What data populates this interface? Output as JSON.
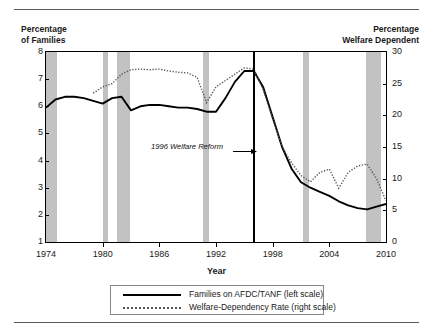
{
  "figure": {
    "left_axis_title": "Percentage\nof Families",
    "right_axis_title": "Percentage\nWelfare Dependent",
    "xaxis_label": "Year",
    "annotation": "1996 Welfare Reform"
  },
  "legend": {
    "items": [
      {
        "label": "Families on AFDC/TANF (left scale)",
        "style": "solid"
      },
      {
        "label": "Welfare-Dependency Rate (right scale)",
        "style": "dotted"
      }
    ]
  },
  "chart_data": {
    "type": "line",
    "title": "",
    "xlabel": "Year",
    "ylabel": "Percentage of Families",
    "y2label": "Percentage Welfare Dependent",
    "xlim": [
      1974,
      2010
    ],
    "ylim": [
      1,
      8
    ],
    "y2lim": [
      0,
      30
    ],
    "xticks": [
      1974,
      1980,
      1986,
      1992,
      1998,
      2004,
      2010
    ],
    "yticks": [
      1,
      2,
      3,
      4,
      5,
      6,
      7,
      8
    ],
    "y2ticks": [
      0,
      5,
      10,
      15,
      20,
      25,
      30
    ],
    "grid": false,
    "legend_position": "below-plot",
    "annotations": [
      {
        "text": "1996 Welfare Reform",
        "x": 1996,
        "style": "italic",
        "arrow": true
      }
    ],
    "recession_bands": [
      {
        "start": 1973.9,
        "end": 1975.2
      },
      {
        "start": 1980.0,
        "end": 1980.6
      },
      {
        "start": 1981.5,
        "end": 1982.9
      },
      {
        "start": 1990.6,
        "end": 1991.3
      },
      {
        "start": 2001.2,
        "end": 2001.9
      },
      {
        "start": 2007.9,
        "end": 2009.5
      }
    ],
    "series": [
      {
        "name": "Families on AFDC/TANF (left scale)",
        "axis": "left",
        "style": "solid",
        "color": "#000000",
        "x": [
          1974,
          1975,
          1976,
          1977,
          1978,
          1979,
          1980,
          1981,
          1982,
          1983,
          1984,
          1985,
          1986,
          1987,
          1988,
          1989,
          1990,
          1991,
          1992,
          1993,
          1994,
          1995,
          1996,
          1997,
          1998,
          1999,
          2000,
          2001,
          2002,
          2003,
          2004,
          2005,
          2006,
          2007,
          2008,
          2009,
          2010
        ],
        "values": [
          5.95,
          6.25,
          6.35,
          6.35,
          6.3,
          6.2,
          6.1,
          6.3,
          6.35,
          5.85,
          6.0,
          6.05,
          6.05,
          6.0,
          5.95,
          5.95,
          5.9,
          5.8,
          5.8,
          6.3,
          6.9,
          7.3,
          7.3,
          6.7,
          5.6,
          4.5,
          3.7,
          3.2,
          3.0,
          2.85,
          2.7,
          2.5,
          2.35,
          2.25,
          2.2,
          2.3,
          2.4
        ]
      },
      {
        "name": "Welfare-Dependency Rate (right scale)",
        "axis": "right",
        "style": "dotted",
        "color": "#555555",
        "x": [
          1979,
          1980,
          1981,
          1982,
          1983,
          1984,
          1985,
          1986,
          1987,
          1988,
          1989,
          1990,
          1991,
          1992,
          1993,
          1994,
          1995,
          1996,
          1997,
          1998,
          1999,
          2000,
          2001,
          2002,
          2003,
          2004,
          2005,
          2006,
          2007,
          2008,
          2009,
          2010
        ],
        "values": [
          23.5,
          24.5,
          25.0,
          26.5,
          27.2,
          27.3,
          27.2,
          27.3,
          27.0,
          26.8,
          26.7,
          26.0,
          22.0,
          24.5,
          25.5,
          26.5,
          27.5,
          27.3,
          24.0,
          19.5,
          15.0,
          12.5,
          10.5,
          9.5,
          11.0,
          11.5,
          8.5,
          11.0,
          12.0,
          12.3,
          10.0,
          6.5
        ]
      }
    ]
  }
}
